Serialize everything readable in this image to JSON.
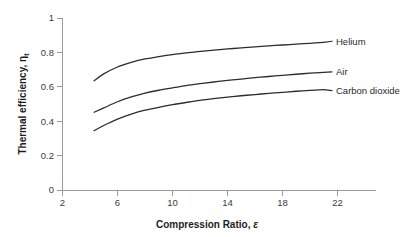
{
  "chart_data": {
    "type": "line",
    "title": "",
    "xlabel": "Compression Ratio, ε",
    "ylabel": "Thermal efficiency, ηt",
    "ylabel_main": "Thermal efficiency, η",
    "ylabel_sub": "t",
    "xlabel_main": "Compression Ratio, ",
    "xlabel_sym": "ε",
    "xlim": [
      2,
      24.8
    ],
    "ylim": [
      0,
      1
    ],
    "xticks": [
      2,
      6,
      10,
      14,
      18,
      22
    ],
    "xtick_labels": [
      "2",
      "6",
      "10",
      "14",
      "18",
      "22"
    ],
    "yticks": [
      0,
      0.2,
      0.4,
      0.6,
      0.8,
      1
    ],
    "ytick_labels": [
      "0",
      "0.2",
      "0.4",
      "0.6",
      "0.8",
      "1"
    ],
    "grid": false,
    "legend_position": "inline-right-end-labels",
    "series": [
      {
        "name": "Helium",
        "label": "Helium",
        "color": "#2c2c2c",
        "label_x": 21.6,
        "label_y": 0.865,
        "x": [
          4.3,
          5.0,
          6.0,
          7.0,
          8.0,
          9.0,
          10.0,
          11.0,
          12.0,
          13.0,
          14.0,
          15.0,
          16.0,
          17.0,
          18.0,
          19.0,
          20.0,
          21.0
        ],
        "y": [
          0.635,
          0.675,
          0.715,
          0.742,
          0.762,
          0.775,
          0.787,
          0.797,
          0.806,
          0.813,
          0.82,
          0.826,
          0.832,
          0.838,
          0.843,
          0.848,
          0.853,
          0.858
        ]
      },
      {
        "name": "Air",
        "label": "Air",
        "color": "#2c2c2c",
        "label_x": 21.6,
        "label_y": 0.687,
        "x": [
          4.3,
          5.0,
          6.0,
          7.0,
          8.0,
          9.0,
          10.0,
          11.0,
          12.0,
          13.0,
          14.0,
          15.0,
          16.0,
          17.0,
          18.0,
          19.0,
          20.0,
          21.0
        ],
        "y": [
          0.452,
          0.477,
          0.513,
          0.541,
          0.563,
          0.58,
          0.594,
          0.607,
          0.618,
          0.628,
          0.637,
          0.645,
          0.653,
          0.66,
          0.667,
          0.673,
          0.679,
          0.684
        ]
      },
      {
        "name": "Carbon dioxide",
        "label": "Carbon dioxide",
        "color": "#2c2c2c",
        "label_x": 21.6,
        "label_y": 0.578,
        "x": [
          4.3,
          5.0,
          6.0,
          7.0,
          8.0,
          9.0,
          10.0,
          11.0,
          12.0,
          13.0,
          14.0,
          15.0,
          16.0,
          17.0,
          18.0,
          19.0,
          20.0,
          21.0
        ],
        "y": [
          0.345,
          0.375,
          0.412,
          0.441,
          0.464,
          0.481,
          0.496,
          0.509,
          0.521,
          0.531,
          0.54,
          0.548,
          0.555,
          0.562,
          0.568,
          0.574,
          0.579,
          0.584
        ]
      }
    ]
  }
}
